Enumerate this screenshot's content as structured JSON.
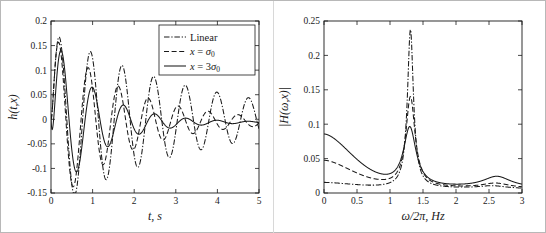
{
  "figure": {
    "background": "#ffffff",
    "line_color": "#1a1a1a",
    "axis_color": "#1a1a1a"
  },
  "chart_data": [
    {
      "id": "time-response",
      "type": "line",
      "title": "",
      "xlabel": "t, s",
      "ylabel": "h(t,x)",
      "xlim": [
        0,
        5
      ],
      "ylim": [
        -0.15,
        0.2
      ],
      "xticks": [
        0,
        1,
        2,
        3,
        4,
        5
      ],
      "xticklabels": [
        "0",
        "1",
        "2",
        "3",
        "4",
        "5"
      ],
      "yticks": [
        -0.15,
        -0.1,
        -0.05,
        0,
        0.05,
        0.1,
        0.15,
        0.2
      ],
      "yticklabels": [
        "-0.15",
        "-0.1",
        "-0.05",
        "0",
        "0.05",
        "0.1",
        "0.15",
        "0.2"
      ],
      "grid": false,
      "legend_position": "upper-right",
      "legend": [
        "Linear",
        "x = σ0",
        "x = 3σ0"
      ],
      "series": [
        {
          "name": "Linear",
          "style": "dashdot",
          "description": "Lightly damped linear impulse response, slowest decay, largest late-time amplitude, period about 0.76 s",
          "amplitude0": 0.183,
          "decay_rate": 0.3,
          "period": 0.76,
          "phase_delay": 0.19,
          "offset": 0.0
        },
        {
          "name": "x = σ0",
          "style": "dashed",
          "description": "Nonlinear response at one sigma, moderate damping, period about 0.72 s",
          "amplitude0": 0.183,
          "decay_rate": 0.58,
          "period": 0.72,
          "phase_delay": 0.18,
          "offset": -0.004
        },
        {
          "name": "x = 3σ0",
          "style": "solid",
          "description": "Nonlinear response at three sigma, strongest damping, fastest decay, period about 0.75 s",
          "amplitude0": 0.183,
          "decay_rate": 0.95,
          "period": 0.75,
          "phase_delay": 0.25,
          "offset": -0.006
        }
      ],
      "annotations": [
        "First peak near t = 0.25 s at h = 0.183 for all three curves",
        "Linear curve retains about 0.04 amplitude at t = 5 s",
        "x = 3 sigma curve decays to about 0.015 amplitude by t = 5 s"
      ]
    },
    {
      "id": "frequency-response",
      "type": "line",
      "title": "",
      "xlabel": "ω/2π, Hz",
      "ylabel": "|H(ω,x)|",
      "xlim": [
        0,
        3
      ],
      "ylim": [
        0,
        0.25
      ],
      "xticks": [
        0,
        0.5,
        1,
        1.5,
        2,
        2.5,
        3
      ],
      "xticklabels": [
        "0",
        "0.5",
        "1",
        "1.5",
        "2",
        "2.5",
        "3"
      ],
      "yticks": [
        0,
        0.05,
        0.1,
        0.15,
        0.2,
        0.25
      ],
      "yticklabels": [
        "0",
        "0.05",
        "0.1",
        "0.15",
        "0.2",
        "0.25"
      ],
      "grid": false,
      "legend_position": "none",
      "series": [
        {
          "name": "Linear",
          "style": "dashdot",
          "description": "Sharp narrow resonance, lowest static gain",
          "dc_value": 0.015,
          "peak_freq": 1.31,
          "peak_value": 0.238,
          "peak_width": 0.055,
          "floor_high": 0.008,
          "secondary_peak_freq": 2.55,
          "secondary_peak_value": 0.004
        },
        {
          "name": "x = σ0",
          "style": "dashed",
          "description": "Broadened resonance, intermediate static gain",
          "dc_value": 0.047,
          "peak_freq": 1.31,
          "peak_value": 0.14,
          "peak_width": 0.085,
          "floor_high": 0.009,
          "secondary_peak_freq": 2.6,
          "secondary_peak_value": 0.007
        },
        {
          "name": "x = 3σ0",
          "style": "solid",
          "description": "Most broadened and lowest resonance peak, highest static gain, visible secondary bump near 2.6 Hz",
          "dc_value": 0.085,
          "peak_freq": 1.3,
          "peak_value": 0.095,
          "peak_width": 0.115,
          "floor_high": 0.01,
          "secondary_peak_freq": 2.62,
          "secondary_peak_value": 0.016
        }
      ],
      "annotations": [
        "Main resonance near 1.3 Hz",
        "All curves converge near 0.01 above 1.8 Hz",
        "Small secondary bump near 2.6 Hz on the x = 3 sigma curve"
      ]
    }
  ]
}
